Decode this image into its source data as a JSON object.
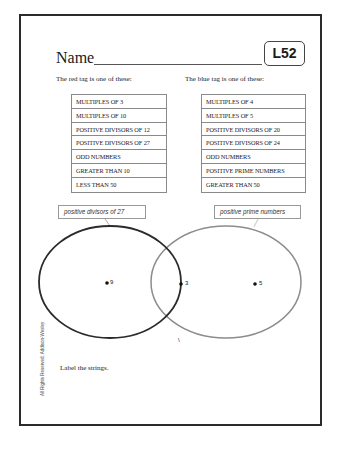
{
  "worksheet": {
    "name_label": "Name",
    "lesson_code": "L52",
    "instructions": "Label the strings.",
    "copyright": "All Rights Reserved.  Addison-Wesley"
  },
  "red_tag": {
    "heading": "The red tag is one of these:",
    "options": [
      "MULTIPLES OF 3",
      "MULTIPLES OF 10",
      "POSITIVE DIVISORS OF 12",
      "POSITIVE DIVISORS OF 27",
      "ODD NUMBERS",
      "GREATER THAN 10",
      "LESS THAN 50"
    ],
    "answer_label": "positive divisors of 27",
    "string_color": "#2b2b2b"
  },
  "blue_tag": {
    "heading": "The blue tag is one of these:",
    "options": [
      "MULTIPLES OF 4",
      "MULTIPLES OF 5",
      "POSITIVE DIVISORS OF 20",
      "POSITIVE DIVISORS OF 24",
      "ODD NUMBERS",
      "POSITIVE PRIME NUMBERS",
      "GREATER THAN 50"
    ],
    "answer_label": "positive prime numbers",
    "string_color": "#8c8c8c"
  },
  "venn": {
    "points": [
      {
        "label": "9",
        "region": "red-only"
      },
      {
        "label": "3",
        "region": "both"
      },
      {
        "label": "5",
        "region": "blue-only"
      }
    ],
    "marker": "\\"
  }
}
